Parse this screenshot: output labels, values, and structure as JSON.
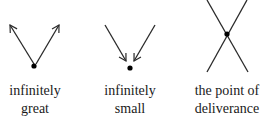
{
  "diagrams": [
    {
      "id": "infinitely-great",
      "label_line1": "infinitely",
      "label_line2": "great"
    },
    {
      "id": "infinitely-small",
      "label_line1": "infinitely",
      "label_line2": "small"
    },
    {
      "id": "point-of-deliverance",
      "label_line1": "the point of",
      "label_line2": "deliverance"
    }
  ],
  "colors": {
    "stroke": "#2a2a2a",
    "dot": "#000000",
    "text": "#1a1a1a"
  }
}
